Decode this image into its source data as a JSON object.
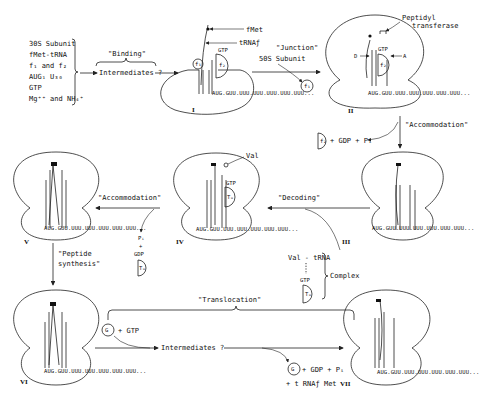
{
  "diagram": {
    "reactants": [
      "30S Subunit",
      "fMet-tRNA",
      "f₁ and f₂",
      "AUG₁ U₃₀",
      "GTP",
      "Mg⁺⁺ and NH₄⁺"
    ],
    "steps": {
      "binding": "\"Binding\"",
      "junction": "\"Junction\"",
      "accommodation_1": "\"Accommodation\"",
      "decoding": "\"Decoding\"",
      "accommodation_2": "\"Accommodation\"",
      "peptide_synthesis_line1": "\"Peptide",
      "peptide_synthesis_line2": "synthesis\"",
      "translocation": "\"Translocation\""
    },
    "labels": {
      "intermediates_1": "Intermediates ?",
      "intermediates_2": "Intermediates ?",
      "fmet": "fMet",
      "trna_f": "tRNAƒ",
      "gtp": "GTP",
      "subunit_50s": "50S Subunit",
      "f1": "f₁",
      "f2": "f₂",
      "peptidyl_1": "Peptidyl",
      "peptidyl_2": "transferase",
      "site_d": "D",
      "site_a": "A",
      "f2_release": "+ GDP + Pᵢ",
      "val": "Val",
      "tu": "Tᵤ",
      "val_trna": "Val - tRNA",
      "complex": "Complex",
      "pi": "Pᵢ",
      "plus": "+",
      "gdp": "GDP",
      "g": "G",
      "g_gtp": "+ GTP",
      "g_release": "+ GDP + Pᵢ",
      "trna_release": "+ t RNAƒ Met"
    },
    "mrna": "AUG.GUU.UUU.UUU.UUU.UUU.UUU...",
    "roman": [
      "I",
      "II",
      "III",
      "IV",
      "V",
      "VI",
      "VII"
    ]
  }
}
